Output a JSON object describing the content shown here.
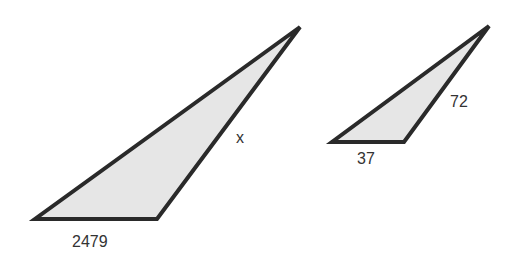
{
  "diagram": {
    "type": "similar-triangles",
    "colors": {
      "fill": "#e6e6e6",
      "stroke": "#2a2a2a",
      "text": "#333333"
    },
    "triangles": [
      {
        "id": "large",
        "points": "35,219 157,219 300,27",
        "labels": {
          "base": "2479",
          "side": "x"
        }
      },
      {
        "id": "small",
        "points": "332,142 404,142 489,26",
        "labels": {
          "base": "37",
          "side": "72"
        }
      }
    ]
  }
}
